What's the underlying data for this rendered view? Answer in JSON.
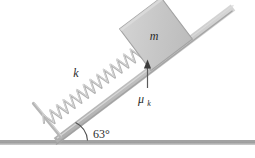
{
  "figure": {
    "name": "inclined-plane-spring-block-diagram",
    "type": "physics-free-body-diagram",
    "background_color": "#ffffff"
  },
  "labels": {
    "spring_constant": "k",
    "block_mass": "m",
    "friction_coefficient_symbol": "μ",
    "friction_coefficient_subscript": "k",
    "incline_angle": "63°"
  },
  "elements": {
    "ground": {
      "name": "ground-line",
      "color": "#9a9a9a",
      "x1": 0,
      "y1": 143,
      "x2": 255,
      "y2": 143,
      "thickness": 4
    },
    "incline": {
      "name": "incline-ramp",
      "color": "#c4c4c4",
      "edge_color": "#a8a8a8",
      "x1": 58,
      "y1": 140,
      "x2": 232,
      "y2": 8,
      "thickness": 7,
      "angle_degrees": 63
    },
    "spring": {
      "name": "spring-coil",
      "color": "#b4b4b4",
      "coils": 22,
      "start_x": 46,
      "start_y": 124,
      "end_x": 140,
      "end_y": 54,
      "amplitude": 7
    },
    "anchor": {
      "name": "spring-anchor-bar",
      "color": "#b0b0b0",
      "x1": 34,
      "y1": 104,
      "x2": 60,
      "y2": 136,
      "thickness": 3
    },
    "block": {
      "name": "block-mass",
      "fill": "#c9c9c9",
      "stroke": "#9e9e9e",
      "center_x": 155,
      "center_y": 35,
      "size": 50,
      "rotation_degrees": -37
    },
    "friction_arrow": {
      "name": "friction-indicator-arrow",
      "color": "#4a4a4a",
      "tip_x": 147,
      "tip_y": 62,
      "tail_x": 147,
      "tail_y": 88
    },
    "angle_arc": {
      "name": "angle-arc",
      "color": "#4a4a4a",
      "center_x": 72,
      "center_y": 140,
      "radius": 18
    }
  },
  "label_positions": {
    "k": {
      "x": 76,
      "y": 76
    },
    "m": {
      "x": 152,
      "y": 42
    },
    "mu": {
      "x": 140,
      "y": 102
    },
    "mu_sub": {
      "x": 149,
      "y": 105
    },
    "angle": {
      "x": 92,
      "y": 138
    }
  }
}
